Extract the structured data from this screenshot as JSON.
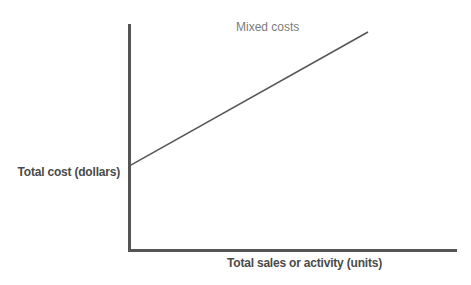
{
  "chart_data": {
    "type": "line",
    "title": "",
    "subtitle": "",
    "xlabel": "Total sales or activity (units)",
    "ylabel": "Total cost (dollars)",
    "annotations": [
      {
        "name": "mixed-costs",
        "text": "Mixed costs",
        "x": 0.45,
        "y": 0.96
      }
    ],
    "series": [
      {
        "name": "Mixed costs",
        "points": [
          {
            "x": 0.0,
            "y": 0.385
          },
          {
            "x": 1.0,
            "y": 1.0
          }
        ],
        "color": "#555555",
        "line_width": 1.5,
        "description": "Straight upward-sloping line beginning above the origin, representing a fixed cost component plus a variable cost component"
      }
    ],
    "axes": {
      "x_axis_color": "#555555",
      "y_axis_color": "#555555",
      "axis_line_width": 3,
      "xlim": [
        0,
        1
      ],
      "ylim": [
        0,
        1
      ],
      "x_ticks": [],
      "y_ticks": [],
      "grid": false,
      "spines": [
        "left",
        "bottom"
      ]
    },
    "legend": {
      "visible": false,
      "position": "none"
    },
    "background_color": "#ffffff",
    "text_color": "#4a4a4a",
    "annotation_color": "#7c7c7c"
  }
}
